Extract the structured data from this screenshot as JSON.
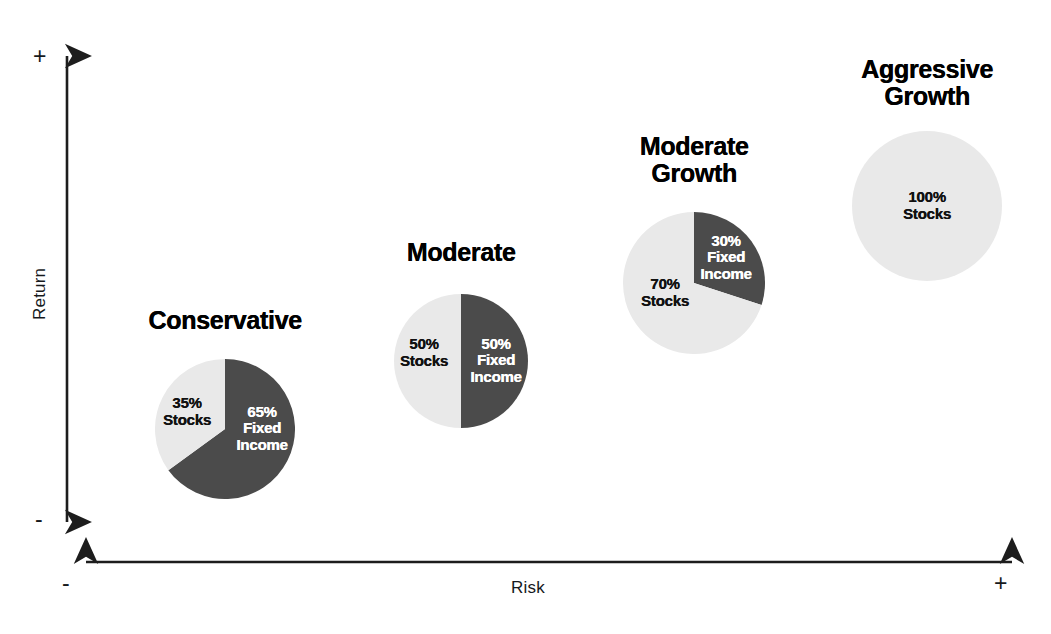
{
  "figure": {
    "background": "#ffffff",
    "axes": {
      "y": {
        "label": "Return",
        "positive_sign": "+",
        "negative_sign": "-",
        "orientation": "vertical",
        "arrow_style": "double-headed"
      },
      "x": {
        "label": "Risk",
        "positive_sign": "+",
        "negative_sign": "-",
        "orientation": "horizontal",
        "arrow_style": "double-headed"
      },
      "line_color": "#1d1d1d"
    }
  },
  "colors": {
    "stocks": "#e9e9e9",
    "fixed_income": "#4b4b4b",
    "stocks_label_text": "#111111",
    "fixed_income_label_text": "#ffffff",
    "title_text": "#000000",
    "axis_text": "#16191c"
  },
  "chart_data": {
    "type": "pie",
    "title": "",
    "xlabel": "Risk",
    "ylabel": "Return",
    "legend": [
      "Stocks",
      "Fixed Income"
    ],
    "note": "Four portfolio allocation pies positioned along a risk/return plane; risk and return both increase left-to-right.",
    "charts": [
      {
        "name": "Conservative",
        "title": "Conservative",
        "cx": 225,
        "cy": 429,
        "r": 70,
        "title_x": 225,
        "title_y": 307,
        "slices": [
          {
            "key": "fixed_income",
            "label": "65%\nFixed\nIncome",
            "percent": 65,
            "asset": "Fixed Income",
            "color": "#4b4b4b",
            "text_color": "#ffffff",
            "start_deg": 0,
            "sweep_deg": 234,
            "label_x": 262,
            "label_y": 429
          },
          {
            "key": "stocks",
            "label": "35%\nStocks",
            "percent": 35,
            "asset": "Stocks",
            "color": "#e9e9e9",
            "text_color": "#111111",
            "start_deg": 234,
            "sweep_deg": 126,
            "label_x": 187,
            "label_y": 412
          }
        ]
      },
      {
        "name": "Moderate",
        "title": "Moderate",
        "cx": 461,
        "cy": 361,
        "r": 67,
        "title_x": 461,
        "title_y": 239,
        "slices": [
          {
            "key": "fixed_income",
            "label": "50%\nFixed\nIncome",
            "percent": 50,
            "asset": "Fixed Income",
            "color": "#4b4b4b",
            "text_color": "#ffffff",
            "start_deg": 0,
            "sweep_deg": 180,
            "label_x": 496,
            "label_y": 361
          },
          {
            "key": "stocks",
            "label": "50%\nStocks",
            "percent": 50,
            "asset": "Stocks",
            "color": "#e9e9e9",
            "text_color": "#111111",
            "start_deg": 180,
            "sweep_deg": 180,
            "label_x": 424,
            "label_y": 353
          }
        ]
      },
      {
        "name": "Moderate Growth",
        "title": "Moderate\nGrowth",
        "cx": 694,
        "cy": 283,
        "r": 71,
        "title_x": 694,
        "title_y": 133,
        "slices": [
          {
            "key": "fixed_income",
            "label": "30%\nFixed\nIncome",
            "percent": 30,
            "asset": "Fixed Income",
            "color": "#4b4b4b",
            "text_color": "#ffffff",
            "start_deg": 0,
            "sweep_deg": 108,
            "label_x": 726,
            "label_y": 258
          },
          {
            "key": "stocks",
            "label": "70%\nStocks",
            "percent": 70,
            "asset": "Stocks",
            "color": "#e9e9e9",
            "text_color": "#111111",
            "start_deg": 108,
            "sweep_deg": 252,
            "label_x": 665,
            "label_y": 293
          }
        ]
      },
      {
        "name": "Aggressive Growth",
        "title": "Aggressive\nGrowth",
        "cx": 927,
        "cy": 206,
        "r": 75,
        "title_x": 927,
        "title_y": 56,
        "slices": [
          {
            "key": "stocks",
            "label": "100%\nStocks",
            "percent": 100,
            "asset": "Stocks",
            "color": "#e9e9e9",
            "text_color": "#111111",
            "start_deg": 0,
            "sweep_deg": 360,
            "label_x": 927,
            "label_y": 206
          }
        ]
      }
    ]
  }
}
